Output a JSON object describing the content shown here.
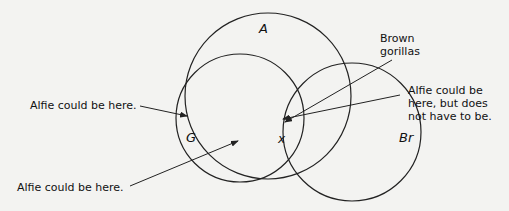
{
  "diagram": {
    "type": "venn",
    "sets": [
      {
        "id": "A",
        "label": "A",
        "cx": 268,
        "cy": 96,
        "r": 83
      },
      {
        "id": "G",
        "label": "G",
        "cx": 240,
        "cy": 118,
        "r": 64
      },
      {
        "id": "Br",
        "label": "Br",
        "cx": 352,
        "cy": 132,
        "r": 69
      }
    ],
    "point_label": "x",
    "annotations": {
      "brown_gorillas": [
        "Brown",
        "gorillas"
      ],
      "alfie_top_left": "Alfie could be here.",
      "alfie_bottom_left": "Alfie could be here.",
      "alfie_right": [
        "Alfie could be",
        "here, but does",
        "not have to be."
      ]
    },
    "colors": {
      "line": "#222222",
      "background": "#f3f3f1"
    }
  }
}
